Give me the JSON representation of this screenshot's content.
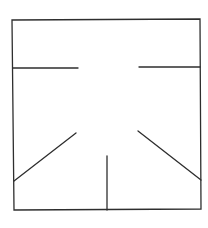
{
  "diagram": {
    "background": "#ffffff",
    "stroke_color": "#2e2e2e",
    "stroke_width": 1.3,
    "frame": {
      "points": "12,20 200,19 201,209 14,210"
    },
    "segments": [
      {
        "name": "left-horizontal-line",
        "x1": 13,
        "y1": 68,
        "x2": 78,
        "y2": 68
      },
      {
        "name": "right-horizontal-line",
        "x1": 139,
        "y1": 67,
        "x2": 200,
        "y2": 67
      },
      {
        "name": "left-diagonal-line",
        "x1": 14,
        "y1": 181,
        "x2": 76,
        "y2": 133
      },
      {
        "name": "right-diagonal-line",
        "x1": 138,
        "y1": 131,
        "x2": 201,
        "y2": 180
      },
      {
        "name": "center-vertical-line",
        "x1": 107,
        "y1": 156,
        "x2": 107,
        "y2": 210
      }
    ]
  }
}
